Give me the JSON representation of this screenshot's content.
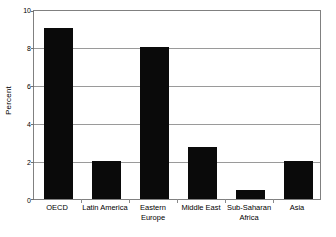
{
  "chart_data": {
    "type": "bar",
    "title": "",
    "subtitle": "",
    "xlabel": "",
    "ylabel": "Percent",
    "categories": [
      "OECD",
      "Latin America",
      "Eastern Europe",
      "Middle East",
      "Sub-Saharan Africa",
      "Asia"
    ],
    "values": [
      9.0,
      2.0,
      8.0,
      2.75,
      0.5,
      2.0
    ],
    "ylim": [
      0,
      10
    ],
    "yticks": [
      0,
      2,
      4,
      6,
      8,
      10
    ],
    "ytick_labels": [
      "0",
      "2",
      "4",
      "6",
      "8",
      "10"
    ],
    "grid": true,
    "legend": false,
    "legend_position": "none",
    "bar_color": "#0a0a0a",
    "background_color": "#ffffff",
    "axis_color": "#808080",
    "gridline_color": "#9a9a9a"
  },
  "category_label_lines": [
    [
      "OECD"
    ],
    [
      "Latin America"
    ],
    [
      "Eastern",
      "Europe"
    ],
    [
      "Middle East"
    ],
    [
      "Sub-Saharan",
      "Africa"
    ],
    [
      "Asia"
    ]
  ]
}
